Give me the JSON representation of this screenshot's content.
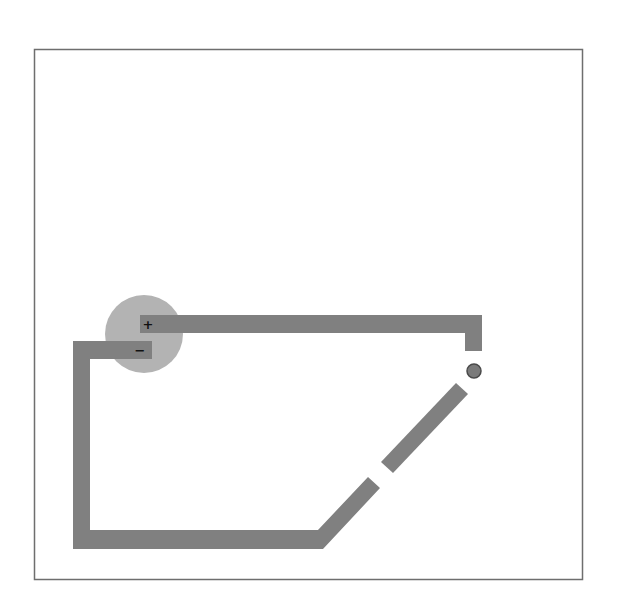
{
  "diagram": {
    "type": "circuit",
    "battery": {
      "positive_label": "+",
      "negative_label": "−"
    },
    "switch": {
      "state": "open"
    },
    "bulb": {
      "state": "off"
    },
    "colors": {
      "wire": "#808080",
      "battery": "#b3b3b3",
      "bulb": "#7a7a7a",
      "frame": "#6e6e6e",
      "background": "#ffffff"
    }
  }
}
